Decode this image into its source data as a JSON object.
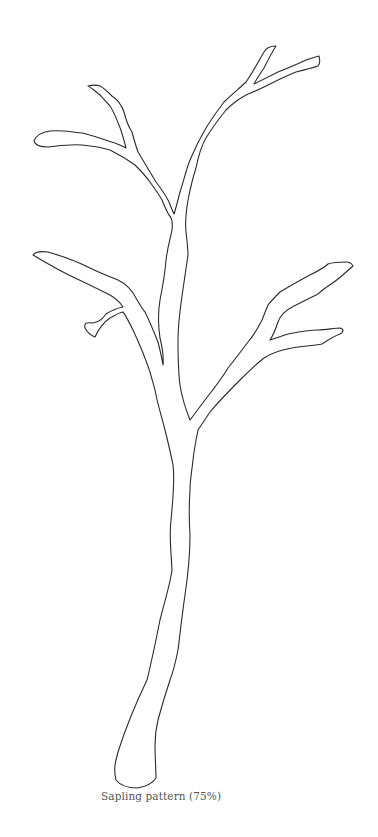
{
  "figure": {
    "caption": "Sapling pattern (75%)",
    "stroke_color": "#2a2a2a",
    "background_color": "#ffffff"
  }
}
